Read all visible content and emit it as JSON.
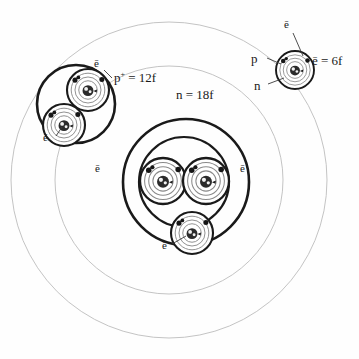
{
  "diagram": {
    "background_color": "#fefefe",
    "ink_color": "#1a1a1a",
    "faint_color": "#c9c9c9",
    "labels": {
      "electron": "ē",
      "proton_base": "p",
      "proton_sup": "+",
      "neutron": "n",
      "electron_value": "ē = 6f",
      "proton_value_base": "p",
      "proton_value_sup": "+",
      "proton_value_rest": " = 12f",
      "neutron_value": "n = 18f"
    },
    "callouts": [
      {
        "name": "electron-top-right",
        "text": "ē",
        "x": 288,
        "y": 26
      },
      {
        "name": "proton-top-right",
        "text": "p",
        "x": 255,
        "y": 59
      },
      {
        "name": "neutron-top-right",
        "text": "n",
        "x": 258,
        "y": 86
      },
      {
        "name": "electron-value",
        "text": "ē = 6f",
        "x": 316,
        "y": 61
      },
      {
        "name": "proton-value",
        "text": " = 12f",
        "x": 118,
        "y": 78
      },
      {
        "name": "neutron-value",
        "text": "n = 18f",
        "x": 180,
        "y": 95
      },
      {
        "name": "electron-upper-left-top",
        "text": "ē",
        "x": 98,
        "y": 65
      },
      {
        "name": "electron-upper-left-bottom",
        "text": "ē",
        "x": 47,
        "y": 139
      },
      {
        "name": "electron-center-left",
        "text": "ē",
        "x": 99,
        "y": 170
      },
      {
        "name": "electron-center-right",
        "text": "ē",
        "x": 244,
        "y": 170
      },
      {
        "name": "electron-bottom",
        "text": "ē",
        "x": 166,
        "y": 247
      }
    ],
    "circles": {
      "faint_outer": {
        "cx": 169,
        "cy": 180,
        "r": 158
      },
      "faint_inner": {
        "cx": 169,
        "cy": 180,
        "r": 114
      },
      "center_outer_bold": {
        "cx": 186,
        "cy": 182,
        "r": 63
      },
      "center_inner_bold": {
        "cx": 184,
        "cy": 182,
        "r": 45
      },
      "upper_left_bold": {
        "cx": 76,
        "cy": 104,
        "r": 39
      }
    },
    "atoms": [
      {
        "name": "atom-top-right",
        "cx": 295,
        "cy": 70,
        "r": 19
      },
      {
        "name": "atom-upper-left-a",
        "cx": 88,
        "cy": 90,
        "r": 21
      },
      {
        "name": "atom-upper-left-b",
        "cx": 64,
        "cy": 125,
        "r": 21
      },
      {
        "name": "atom-center-left",
        "cx": 163,
        "cy": 181,
        "r": 23
      },
      {
        "name": "atom-center-right",
        "cx": 206,
        "cy": 181,
        "r": 23
      },
      {
        "name": "atom-bottom",
        "cx": 192,
        "cy": 233,
        "r": 21
      }
    ]
  }
}
